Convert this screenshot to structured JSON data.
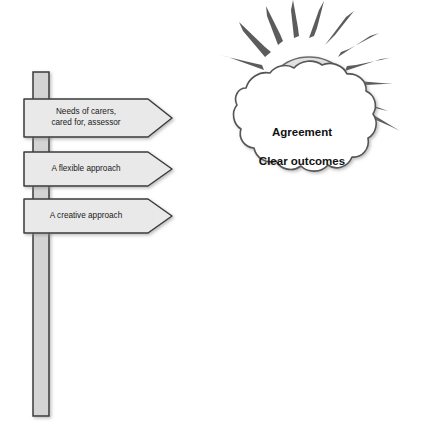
{
  "diagram": {
    "background_color": "#ffffff",
    "line_color": "#4d4d4d",
    "post": {
      "label": "signpost-post",
      "fill_color": "#d4d4d4",
      "stroke_color": "#3a3a3a"
    },
    "signs": [
      {
        "id": "sign-needs",
        "text": "Needs of carers,\ncared for, assessor",
        "fill_color": "#e9e9e9",
        "stroke_color": "#3a3a3a"
      },
      {
        "id": "sign-flexible",
        "text": "A flexible approach",
        "fill_color": "#e9e9e9",
        "stroke_color": "#3a3a3a"
      },
      {
        "id": "sign-creative",
        "text": "A creative approach",
        "fill_color": "#e9e9e9",
        "stroke_color": "#3a3a3a"
      }
    ],
    "cloud": {
      "label": "cloud-shape",
      "text": "Agreement\nClear outcomes",
      "text_line_1": "Agreement",
      "text_line_2": "Clear outcomes",
      "fill_color": "#ffffff",
      "stroke_color": "#555555"
    },
    "sun": {
      "label": "sun-shape",
      "fill_color": "#e2e2e2",
      "stroke_color": "#6b6b6b",
      "ray_color": "#5a5a5a",
      "ray_count": 11
    }
  }
}
